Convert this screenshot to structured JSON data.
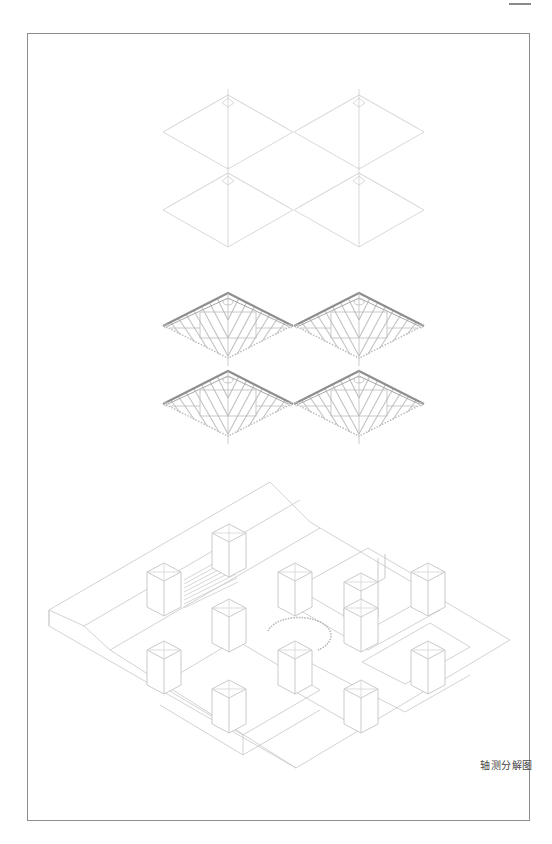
{
  "page": {
    "caption": "轴测分解图",
    "frame_color": "#8c8c8c",
    "line_color": "#c8c8c8",
    "hatch_color": "#b0b0b0",
    "ridge_dark": "#8e8e8e"
  },
  "layers": [
    {
      "name": "roof-outline-layer",
      "description": "roof outlines",
      "count": 4
    },
    {
      "name": "roof-framing-layer",
      "description": "hatched roof rafters",
      "count": 4
    },
    {
      "name": "base-plan-layer",
      "description": "courtyard walls, towers, stairs, circular plaza",
      "count": 1
    }
  ]
}
